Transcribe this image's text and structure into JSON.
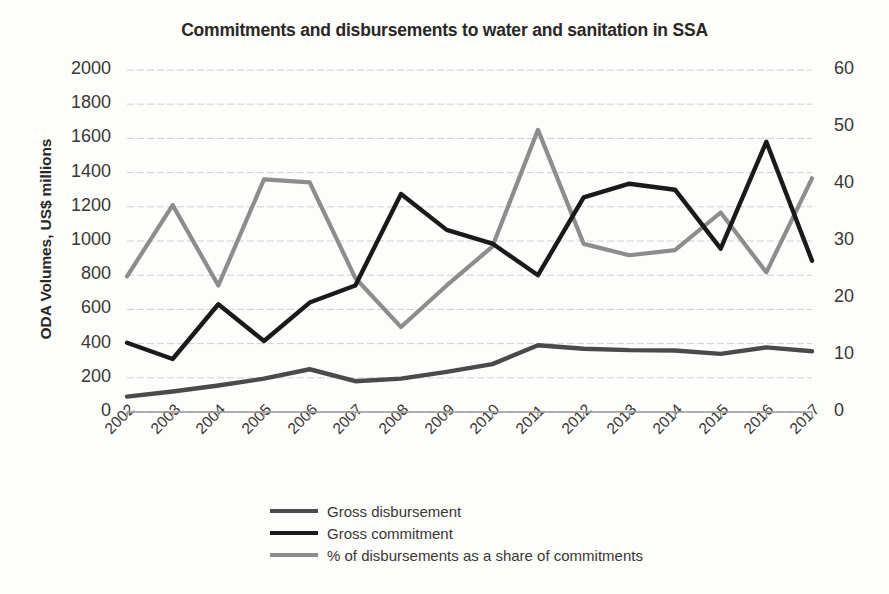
{
  "chart_data": {
    "type": "line",
    "title": "Commitments and disbursements to water and sanitation in SSA",
    "xlabel": "",
    "ylabel": "ODA Volumes, US$ millions",
    "y2label": "",
    "grid": true,
    "legend_position": "bottom",
    "categories": [
      "2002",
      "2003",
      "2004",
      "2005",
      "2006",
      "2007",
      "2008",
      "2009",
      "2010",
      "2011",
      "2012",
      "2013",
      "2014",
      "2015",
      "2016",
      "2017"
    ],
    "ylim": [
      0,
      2000
    ],
    "yticks": [
      "0",
      "200",
      "400",
      "600",
      "800",
      "1000",
      "1200",
      "1400",
      "1600",
      "1800",
      "2000"
    ],
    "y2lim": [
      0,
      60
    ],
    "y2ticks": [
      "0",
      "10",
      "20",
      "30",
      "40",
      "50",
      "60"
    ],
    "series": [
      {
        "name": "Gross disbursement",
        "axis": "left",
        "color": "#4a4a4a",
        "values": [
          90,
          120,
          155,
          195,
          250,
          180,
          195,
          235,
          280,
          390,
          370,
          362,
          360,
          340,
          378,
          355
        ]
      },
      {
        "name": "Gross commitment",
        "axis": "left",
        "color": "#1a1a1a",
        "values": [
          405,
          310,
          630,
          415,
          640,
          740,
          1275,
          1065,
          985,
          800,
          1255,
          1335,
          1300,
          955,
          1580,
          885
        ]
      },
      {
        "name": "% of disbursements as a share of commitments",
        "axis": "right",
        "color": "#8d8d8d",
        "values": [
          23.8,
          36.3,
          22.2,
          40.8,
          40.3,
          23.5,
          14.9,
          22.2,
          29.0,
          49.5,
          29.5,
          27.5,
          28.4,
          35.0,
          24.5,
          41.0
        ]
      }
    ]
  },
  "legend": {
    "items": [
      {
        "label": "Gross disbursement",
        "color": "#4a4a4a"
      },
      {
        "label": "Gross commitment",
        "color": "#1a1a1a"
      },
      {
        "label": "% of disbursements as a share of commitments",
        "color": "#8d8d8d"
      }
    ]
  }
}
